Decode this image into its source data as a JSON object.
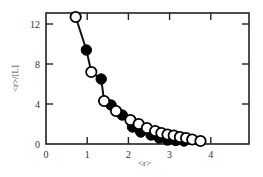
{
  "chart_data": {
    "type": "scatter",
    "title": "",
    "xlabel": "<r>",
    "ylabel": "<r>/[L]",
    "xlim": [
      0,
      5
    ],
    "ylim": [
      0,
      13
    ],
    "xticks": [
      0,
      1,
      2,
      3,
      4
    ],
    "yticks": [
      0,
      4,
      8,
      12
    ],
    "grid": false,
    "legend": null,
    "series": [
      {
        "name": "open circles",
        "marker": "open-circle",
        "points": [
          [
            0.72,
            12.7
          ],
          [
            1.1,
            7.2
          ],
          [
            1.41,
            4.3
          ],
          [
            1.7,
            3.3
          ],
          [
            2.05,
            2.4
          ],
          [
            2.25,
            2.0
          ],
          [
            2.45,
            1.6
          ],
          [
            2.65,
            1.3
          ],
          [
            2.8,
            1.1
          ],
          [
            2.95,
            0.95
          ],
          [
            3.1,
            0.85
          ],
          [
            3.25,
            0.7
          ],
          [
            3.4,
            0.6
          ],
          [
            3.55,
            0.45
          ],
          [
            3.75,
            0.3
          ]
        ]
      },
      {
        "name": "filled circles",
        "marker": "filled-circle",
        "points": [
          [
            0.98,
            9.4
          ],
          [
            1.34,
            6.5
          ],
          [
            1.58,
            3.9
          ],
          [
            1.85,
            2.9
          ],
          [
            2.1,
            1.7
          ],
          [
            2.3,
            1.2
          ],
          [
            2.55,
            0.9
          ],
          [
            2.75,
            0.6
          ],
          [
            2.95,
            0.4
          ],
          [
            3.15,
            0.35
          ],
          [
            3.35,
            0.3
          ]
        ]
      }
    ],
    "fit_line": {
      "style": "solid",
      "points": [
        [
          0.72,
          12.7
        ],
        [
          0.98,
          9.4
        ],
        [
          1.1,
          7.2
        ],
        [
          1.34,
          6.5
        ],
        [
          1.41,
          4.3
        ],
        [
          1.58,
          3.9
        ],
        [
          2.0,
          2.3
        ],
        [
          2.5,
          1.4
        ],
        [
          3.0,
          0.8
        ],
        [
          3.5,
          0.5
        ],
        [
          3.75,
          0.3
        ]
      ]
    }
  }
}
